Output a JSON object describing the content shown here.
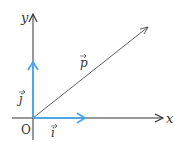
{
  "diagram": {
    "title": "",
    "axes": {
      "x_label": "x",
      "y_label": "y",
      "origin_label": "O"
    },
    "vectors": [
      {
        "name": "i",
        "label": "i",
        "color": "#4da6e8"
      },
      {
        "name": "j",
        "label": "j",
        "color": "#4da6e8"
      },
      {
        "name": "p",
        "label": "p",
        "color": "#333333"
      }
    ],
    "colors": {
      "axis": "#333333",
      "unit_vector": "#4da6e8"
    }
  }
}
